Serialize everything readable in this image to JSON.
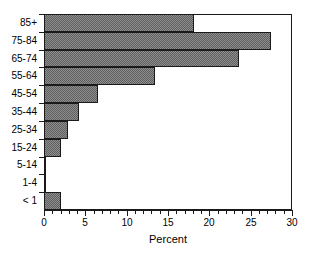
{
  "chart_data": {
    "type": "bar",
    "orientation": "horizontal",
    "title": "",
    "xlabel": "Percent",
    "ylabel": "",
    "categories": [
      "85+",
      "75-84",
      "65-74",
      "55-64",
      "45-54",
      "35-44",
      "25-34",
      "15-24",
      "5-14",
      "1-4",
      "< 1"
    ],
    "values": [
      18.1,
      27.4,
      23.6,
      13.4,
      6.5,
      4.2,
      2.9,
      2.0,
      0.3,
      0.3,
      2.0
    ],
    "xlim": [
      0,
      30
    ],
    "xticks": [
      0,
      5,
      10,
      15,
      20,
      25,
      30
    ],
    "xtick_labels": [
      "0",
      "5",
      "10",
      "15",
      "20",
      "25",
      "30"
    ],
    "minor_tick_step": 1,
    "grid": false,
    "legend": null,
    "bar_fill_color": "#8f8f8f",
    "bar_pattern": "checkerboard-dither",
    "bar_edge_color": "#1a1a1a",
    "background_color": "#ffffff"
  },
  "axes": {
    "x_axis_title": "Percent",
    "y_axis_title": ""
  }
}
